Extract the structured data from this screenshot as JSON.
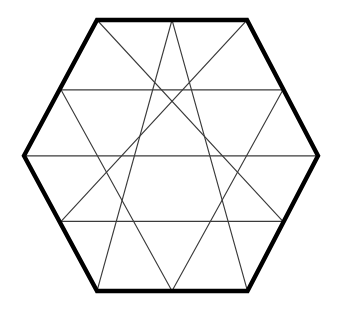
{
  "figure": {
    "type": "geometric-diagram",
    "shape_name": "hexagon",
    "background_color": "#ffffff",
    "outline_color": "#000000",
    "outline_width_px": 4.4,
    "grid_color": "#3b3b3b",
    "grid_width_px": 1.15,
    "canvas": {
      "width": 340,
      "height": 312
    },
    "subdivision": {
      "side_divisions": 2,
      "triangle_rows": 4,
      "total_small_triangles": 24,
      "row_triangle_counts": [
        4,
        8,
        8,
        4
      ]
    },
    "geometry": {
      "center": {
        "x": 171.5,
        "y": 155.8
      },
      "circumradius_px": 147,
      "row_y": [
        20.0,
        89.8,
        155.8,
        221.4,
        291.0
      ],
      "hexagon_vertices": [
        {
          "name": "top-left",
          "x": 97.0,
          "y": 20.0
        },
        {
          "name": "top-right",
          "x": 247.0,
          "y": 20.0
        },
        {
          "name": "right",
          "x": 318.0,
          "y": 155.8
        },
        {
          "name": "bottom-right",
          "x": 247.5,
          "y": 291.0
        },
        {
          "name": "bottom-left",
          "x": 97.0,
          "y": 291.0
        },
        {
          "name": "left",
          "x": 24.0,
          "y": 155.8
        }
      ],
      "lattice_rows": [
        {
          "y": 20.0,
          "x_points": [
            97.0,
            172.0,
            247.0
          ]
        },
        {
          "y": 89.8,
          "x_points": [
            61.0,
            135.0,
            209.0,
            283.0
          ]
        },
        {
          "y": 155.8,
          "x_points": [
            24.0,
            99.0,
            172.0,
            246.0,
            318.0
          ]
        },
        {
          "y": 221.4,
          "x_points": [
            61.0,
            135.0,
            209.0,
            283.0
          ]
        },
        {
          "y": 291.0,
          "x_points": [
            97.0,
            172.0,
            247.5
          ]
        }
      ],
      "interior_horizontal_lines": [
        {
          "y": 89.8,
          "x1": 61.0,
          "x2": 283.0
        },
        {
          "y": 155.8,
          "x1": 24.0,
          "x2": 318.0
        },
        {
          "y": 221.4,
          "x1": 61.0,
          "x2": 283.0
        }
      ],
      "interior_down_right_lines": [
        {
          "x1": 97.0,
          "y1": 20.0,
          "x2": 283.0,
          "y2": 221.4
        },
        {
          "x1": 172.0,
          "y1": 20.0,
          "x2": 247.5,
          "y2": 291.0
        },
        {
          "x1": 61.0,
          "y1": 89.8,
          "x2": 172.0,
          "y2": 291.0
        },
        {
          "x1": 24.0,
          "y1": 155.8,
          "x2": 97.0,
          "y2": 291.0
        }
      ],
      "interior_down_left_lines": [
        {
          "x1": 247.0,
          "y1": 20.0,
          "x2": 61.0,
          "y2": 221.4
        },
        {
          "x1": 172.0,
          "y1": 20.0,
          "x2": 97.0,
          "y2": 291.0
        },
        {
          "x1": 283.0,
          "y1": 89.8,
          "x2": 172.0,
          "y2": 291.0
        },
        {
          "x1": 318.0,
          "y1": 155.8,
          "x2": 247.5,
          "y2": 291.0
        }
      ]
    },
    "outline_path": "M 97,20 L 247,20 L 318,155.8 L 247.5,291 L 97,291 L 24,155.8 Z"
  }
}
